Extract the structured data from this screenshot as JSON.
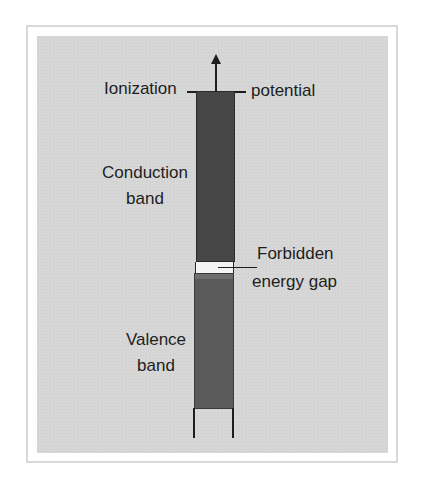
{
  "diagram": {
    "type": "energy-band-diagram",
    "labels": {
      "ionization_left": "Ionization",
      "ionization_right": "potential",
      "conduction_line1": "Conduction",
      "conduction_line2": "band",
      "gap_line1": "Forbidden",
      "gap_line2": "energy gap",
      "valence_line1": "Valence",
      "valence_line2": "band"
    },
    "colors": {
      "panel_background": "#d6d6d6",
      "conduction_band": "#474747",
      "forbidden_gap": "#f4f4f4",
      "valence_band": "#5a5a5a",
      "lines": "#1e1e1e"
    },
    "elements": [
      {
        "name": "ionization-arrow",
        "direction": "up"
      },
      {
        "name": "conduction-band"
      },
      {
        "name": "forbidden-energy-gap"
      },
      {
        "name": "valence-band"
      }
    ]
  }
}
